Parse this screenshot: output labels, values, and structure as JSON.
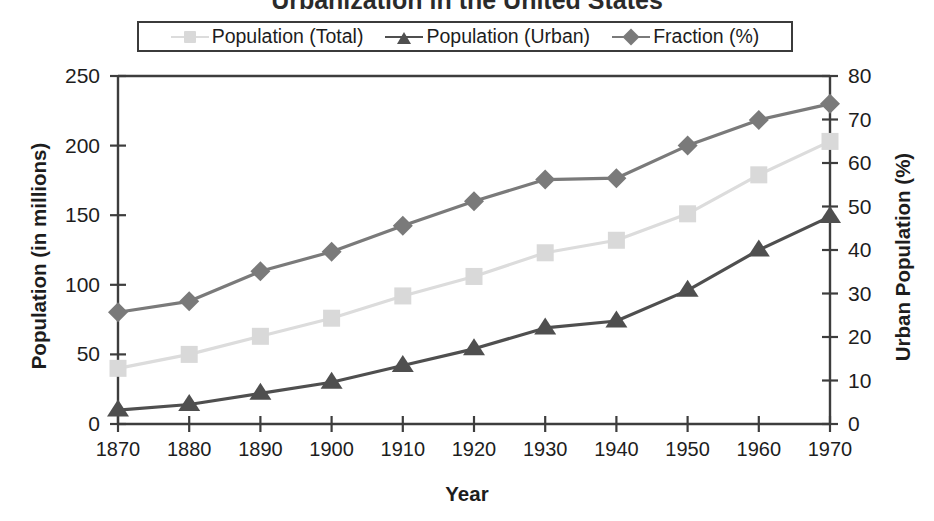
{
  "chart_data": {
    "type": "line",
    "title": "Urbanization in the United States",
    "xlabel": "Year",
    "ylabel": "Population (in millions)",
    "y2label": "Urban Population (%)",
    "x": [
      1870,
      1880,
      1890,
      1900,
      1910,
      1920,
      1930,
      1940,
      1950,
      1960,
      1970
    ],
    "categories": [
      "1870",
      "1880",
      "1890",
      "1900",
      "1910",
      "1920",
      "1930",
      "1940",
      "1950",
      "1960",
      "1970"
    ],
    "xlim": [
      1870,
      1970
    ],
    "ylim": [
      0,
      250
    ],
    "y2lim": [
      0,
      80
    ],
    "yticks": [
      "0",
      "50",
      "100",
      "150",
      "200",
      "250"
    ],
    "ytick_values": [
      0,
      50,
      100,
      150,
      200,
      250
    ],
    "y2ticks": [
      "0",
      "10",
      "20",
      "30",
      "40",
      "50",
      "60",
      "70",
      "80"
    ],
    "y2tick_values": [
      0,
      10,
      20,
      30,
      40,
      50,
      60,
      70,
      80
    ],
    "grid": false,
    "legend_position": "top",
    "series": [
      {
        "name": "Population (Total)",
        "axis": "left",
        "marker": "square",
        "color": "#d9d9d9",
        "line_color": "#dcdcdc",
        "values": [
          40,
          50,
          63,
          76,
          92,
          106,
          123,
          132,
          151,
          179,
          203
        ]
      },
      {
        "name": "Population (Urban)",
        "axis": "left",
        "marker": "triangle",
        "color": "#4f4f4f",
        "line_color": "#4f4f4f",
        "values": [
          10,
          14,
          22,
          30,
          42,
          54,
          69,
          74,
          96,
          125,
          149
        ]
      },
      {
        "name": "Fraction (%)",
        "axis": "right",
        "marker": "diamond",
        "color": "#7a7a7a",
        "line_color": "#7a7a7a",
        "values": [
          25.7,
          28.2,
          35.1,
          39.6,
          45.6,
          51.2,
          56.2,
          56.5,
          64.0,
          69.9,
          73.6
        ]
      }
    ]
  },
  "legend": {
    "items": [
      {
        "label": "Population (Total)"
      },
      {
        "label": "Population (Urban)"
      },
      {
        "label": "Fraction (%)"
      }
    ]
  }
}
